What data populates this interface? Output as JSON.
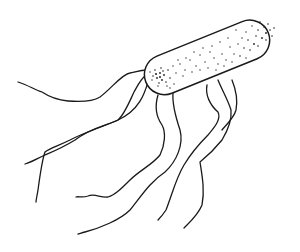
{
  "figure": {
    "description": "Line drawing of a stippled rod-shaped bacterial cell with multiple long wavy flagella",
    "colors": {
      "background": "#ffffff",
      "ink": "#1a1a1a"
    }
  }
}
